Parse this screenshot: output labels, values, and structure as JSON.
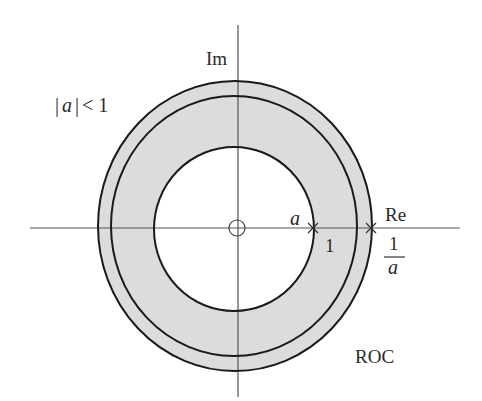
{
  "diagram": {
    "condition_label": "|a| < 1",
    "condition_parts": {
      "bar_left": "|",
      "var": "a",
      "bar_right": "|",
      "op": "<",
      "value": "1"
    },
    "axes": {
      "imag_label": "Im",
      "real_label": "Re"
    },
    "points": {
      "pole_a_label": "a",
      "unit_circle_label": "1",
      "pole_inv_numerator": "1",
      "pole_inv_denominator": "a"
    },
    "region_label": "ROC",
    "colors": {
      "shade": "#dcdcdc",
      "stroke": "#1a1a1a",
      "axis": "#555555",
      "background": "#ffffff"
    },
    "circles": [
      {
        "name": "inner-circle",
        "radius_label": "|a|"
      },
      {
        "name": "unit-circle",
        "radius_label": "1"
      },
      {
        "name": "outer-circle",
        "radius_label": "1/|a|"
      }
    ],
    "markers": [
      {
        "type": "zero",
        "glyph": "o",
        "position": "origin"
      },
      {
        "type": "pole",
        "glyph": "x",
        "position": "a"
      },
      {
        "type": "pole",
        "glyph": "x",
        "position": "1/a"
      }
    ]
  }
}
